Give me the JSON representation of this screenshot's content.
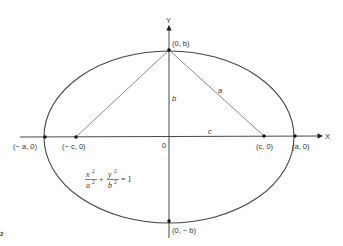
{
  "diagram": {
    "type": "ellipse-geometry",
    "axes": {
      "x_label": "X",
      "y_label": "Y",
      "origin_label": "0"
    },
    "points": [
      {
        "id": "vertex-left",
        "label": "(− a, 0)"
      },
      {
        "id": "focus-left",
        "label": "(− c, 0)"
      },
      {
        "id": "focus-right",
        "label": "(c, 0)"
      },
      {
        "id": "vertex-right",
        "label": "(a, 0)"
      },
      {
        "id": "covertex-top",
        "label": "(0, b)"
      },
      {
        "id": "covertex-bottom",
        "label": "(0, − b)"
      }
    ],
    "segments": {
      "b": "b",
      "a": "a",
      "c": "c"
    },
    "equation": {
      "num1": "x",
      "den1": "a",
      "num2": "y",
      "den2": "b",
      "exp": "2",
      "plus": "+",
      "equals": "= 1"
    },
    "corner_mark": "2"
  }
}
